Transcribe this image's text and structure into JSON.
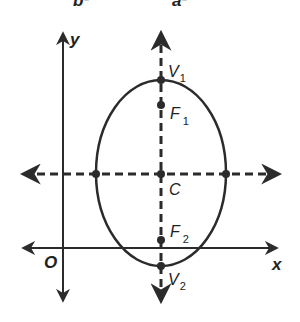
{
  "top_labels": {
    "left": "b²",
    "right": "a²"
  },
  "axes": {
    "x_label": "x",
    "y_label": "y",
    "origin_label": "O"
  },
  "points": {
    "v1": {
      "main": "V",
      "sub": "1"
    },
    "f1": {
      "main": "F",
      "sub": "1"
    },
    "center": {
      "main": "C"
    },
    "f2": {
      "main": "F",
      "sub": "2"
    },
    "v2": {
      "main": "V",
      "sub": "2"
    }
  },
  "colors": {
    "stroke": "#2b2b2b",
    "background": "#ffffff"
  }
}
